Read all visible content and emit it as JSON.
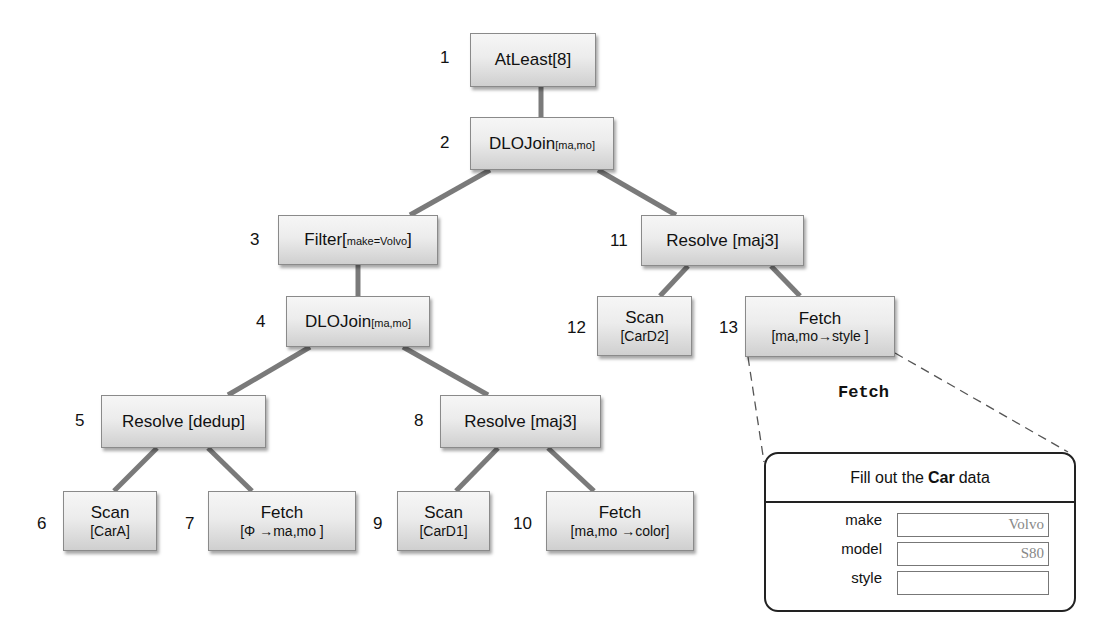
{
  "diagram": {
    "type": "query-plan-tree",
    "nodes": [
      {
        "id": "1",
        "main": "AtLeast[8]",
        "sub": "",
        "line2": ""
      },
      {
        "id": "2",
        "main": "DLOJoin",
        "sub": "[ma,mo]",
        "line2": ""
      },
      {
        "id": "3",
        "main": "Filter[",
        "sub": "make=Volvo",
        "suffix": "]",
        "line2": ""
      },
      {
        "id": "4",
        "main": "DLOJoin",
        "sub": "[ma,mo]",
        "line2": ""
      },
      {
        "id": "5",
        "main": "Resolve [dedup]",
        "sub": "",
        "line2": ""
      },
      {
        "id": "6",
        "main": "Scan",
        "sub": "",
        "line2": "[CarA]"
      },
      {
        "id": "7",
        "main": "Fetch",
        "sub": "",
        "line2": "[Φ →ma,mo ]"
      },
      {
        "id": "8",
        "main": "Resolve [maj3]",
        "sub": "",
        "line2": ""
      },
      {
        "id": "9",
        "main": "Scan",
        "sub": "",
        "line2": "[CarD1]"
      },
      {
        "id": "10",
        "main": "Fetch",
        "sub": "",
        "line2": "[ma,mo →color]"
      },
      {
        "id": "11",
        "main": "Resolve [maj3]",
        "sub": "",
        "line2": ""
      },
      {
        "id": "12",
        "main": "Scan",
        "sub": "",
        "line2": "[CarD2]"
      },
      {
        "id": "13",
        "main": "Fetch",
        "sub": "",
        "line2": "[ma,mo→style ]"
      }
    ],
    "edges": [
      [
        "1",
        "2"
      ],
      [
        "2",
        "3"
      ],
      [
        "2",
        "11"
      ],
      [
        "3",
        "4"
      ],
      [
        "4",
        "5"
      ],
      [
        "4",
        "8"
      ],
      [
        "5",
        "6"
      ],
      [
        "5",
        "7"
      ],
      [
        "8",
        "9"
      ],
      [
        "8",
        "10"
      ],
      [
        "11",
        "12"
      ],
      [
        "11",
        "13"
      ]
    ],
    "callout": {
      "from_node": "13",
      "title": "Fetch",
      "form": {
        "header_prefix": "Fill out the",
        "header_bold": "Car",
        "header_suffix": "data",
        "fields": [
          {
            "label": "make",
            "value": "Volvo"
          },
          {
            "label": "model",
            "value": "S80"
          },
          {
            "label": "style",
            "value": ""
          }
        ]
      }
    }
  }
}
